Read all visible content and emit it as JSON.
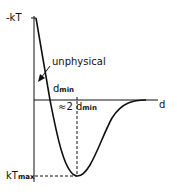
{
  "diagram": {
    "type": "potential energy curve",
    "y_axis_top_label": "-kT",
    "y_axis_bottom_label_main": "kT",
    "y_axis_bottom_label_sub": "max",
    "x_axis_label": "d",
    "annotation_unphysical": "unphysical",
    "dmin_label_main": "d",
    "dmin_label_sub": "min",
    "approx_label_prefix": "≈2",
    "approx_label_main": "d",
    "approx_label_sub": "min",
    "colors": {
      "line": "#111111",
      "background": "#ffffff"
    }
  }
}
